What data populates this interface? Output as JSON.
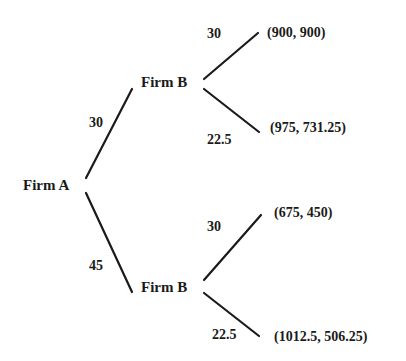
{
  "diagram": {
    "type": "game-tree",
    "root": {
      "label": "Firm A"
    },
    "nodes": [
      {
        "id": "b_upper",
        "label": "Firm B"
      },
      {
        "id": "b_lower",
        "label": "Firm B"
      }
    ],
    "edges": {
      "a_to_upper": "30",
      "a_to_lower": "45",
      "upper_up": "30",
      "upper_down": "22.5",
      "lower_up": "30",
      "lower_down": "22.5"
    },
    "payoffs": [
      "(900, 900)",
      "(975, 731.25)",
      "(675, 450)",
      "(1012.5, 506.25)"
    ],
    "colors": {
      "line": "#1a1a1a",
      "text": "#1a1a1a",
      "background": "#ffffff"
    }
  }
}
